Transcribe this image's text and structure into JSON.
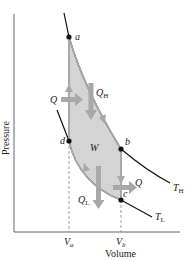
{
  "diagram": {
    "type": "PV diagram (Stirling cycle)",
    "axes": {
      "x_label": "Volume",
      "y_label": "Pressure",
      "x_ticks": [
        {
          "label": "V",
          "sub": "a"
        },
        {
          "label": "V",
          "sub": "b"
        }
      ]
    },
    "points": {
      "a": "a",
      "b": "b",
      "c": "c",
      "d": "d"
    },
    "region_label": "W",
    "heat_labels": {
      "q_in_left": "Q",
      "q_h": {
        "main": "Q",
        "sub": "H"
      },
      "q_l": {
        "main": "Q",
        "sub": "L"
      },
      "q_out_right": "Q"
    },
    "isotherms": {
      "hot": {
        "main": "T",
        "sub": "H"
      },
      "cold": {
        "main": "T",
        "sub": "L"
      }
    },
    "colors": {
      "fill": "#d4d4d4",
      "arrow": "#a8a8a8",
      "curve": "#111111",
      "axis": "#555555",
      "dashed": "#888888"
    }
  }
}
